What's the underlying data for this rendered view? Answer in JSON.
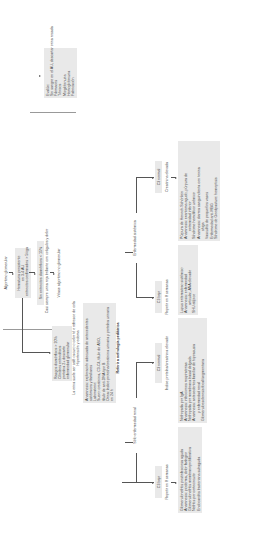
{
  "diagram": {
    "orientation": "rotated-90-ccw",
    "root": "Algoritmo glomerular",
    "step1": [
      "Hematuria persistente",
      "en 3-4 AU",
      "eritrocitos confirmados > 5/cga"
    ],
    "step2": "Sin eritrocitos dismórficos < 15%",
    "step2_note": "Casi siempre urina roja brillante con coágulos y dolor",
    "step3": "Véase algoritmo no glomerular",
    "evaluate_box": [
      "Evalúe:",
      "Sin sangre en el AU, descartar orina rosada",
      "Fármacos",
      "Tóxicos",
      "Mioglobinuria",
      "Hemoglobinuria",
      "Fabricación"
    ],
    "glomerular_criteria": [
      "Rasgos dismórficos > 20%",
      "Cilindros eritrocíticos",
      "proteína 2+ descarte",
      "enfermedad glomerular"
    ],
    "glomerular_note": [
      "La orina suele ser café oscuro o color té o refresco de cola",
      "Hipertensión y edema"
    ],
    "workup_box": [
      "Anamnesis: exploración adecuada de antecedentes",
      "sistémicos y familiares",
      "Laboratorio:",
      "Suero: creatinina, C3-C4, título de ASO,",
      "título de anti-DNA tipo B",
      "Orina: índice proteína/creatinina urinaria y proteína urinaria",
      "en 24 h"
    ],
    "referral": "Referir a nefrología pediátrica",
    "branch_renal": "Sólo enfermedad renal",
    "branch_systemic": "Enfermedad sistémica",
    "renal_low": {
      "label": "C3 bajo",
      "note": "Repetir en 8 semanas",
      "items": [
        "Glomerulonefritis postinfecciosa aguda",
        "Anamnesis: pioderma, dolor faríngeo",
        "Glomerulonefritis membranoproliferativa",
        "Nefritis por cortocircuito",
        "Endocarditis bacteriana subaguda"
      ]
    },
    "renal_normal": {
      "label": "C3 normal",
      "note": "Índice proteína/creatinina elevado",
      "items": [
        "Nefropatía por IgA",
        "Anamnesis: infecciones respiratorias",
        "Nefropatía por membrana basal delgada",
        "Anamnesis: antecedentes familiar de hipoacusia",
        "y enfermedad renal",
        "Glomeruloesclerosis focal/segmentaria"
      ]
    },
    "systemic_low": {
      "label": "C3 bajo",
      "note": "Repetir en 8 semanas",
      "items": [
        "Lupus eritematoso sistémico",
        "Anamnesis: enfermedad",
        "articular, ANA elevado",
        "SHU atípico"
      ]
    },
    "systemic_normal": {
      "label": "C3 normal",
      "note": "Creatinina elevada",
      "items": [
        "Púrpura de Henoch-Schönlein",
        "Anamnesis: exantema agudo, púrpura de",
        "extremidad inferior",
        "Síndrome hemolítico urémico",
        "Anamnesis: diarrea sanguinolenta con toxina",
        "shiga",
        "Vasculitis de pequeños vasos",
        "Enfermedad anti-MBG",
        "Síndrome de Goodpasture: hemoptisis"
      ]
    }
  }
}
